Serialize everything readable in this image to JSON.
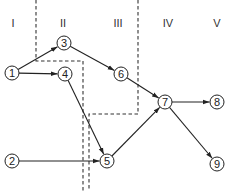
{
  "diagram": {
    "type": "network-stage-diagram",
    "stages": [
      {
        "id": "I",
        "label": "I",
        "x": 13,
        "y": 27
      },
      {
        "id": "II",
        "label": "II",
        "x": 63,
        "y": 27
      },
      {
        "id": "III",
        "label": "III",
        "x": 118,
        "y": 27
      },
      {
        "id": "IV",
        "label": "IV",
        "x": 168,
        "y": 27
      },
      {
        "id": "V",
        "label": "V",
        "x": 217,
        "y": 27
      }
    ],
    "nodes": [
      {
        "id": "1",
        "label": "1",
        "x": 12,
        "y": 73
      },
      {
        "id": "2",
        "label": "2",
        "x": 12,
        "y": 161
      },
      {
        "id": "3",
        "label": "3",
        "x": 64,
        "y": 43
      },
      {
        "id": "4",
        "label": "4",
        "x": 65,
        "y": 74
      },
      {
        "id": "5",
        "label": "5",
        "x": 107,
        "y": 161
      },
      {
        "id": "6",
        "label": "6",
        "x": 121,
        "y": 74
      },
      {
        "id": "7",
        "label": "7",
        "x": 165,
        "y": 102
      },
      {
        "id": "8",
        "label": "8",
        "x": 217,
        "y": 102
      },
      {
        "id": "9",
        "label": "9",
        "x": 217,
        "y": 164
      }
    ],
    "edges": [
      {
        "from": "1",
        "to": "3"
      },
      {
        "from": "1",
        "to": "4"
      },
      {
        "from": "3",
        "to": "6"
      },
      {
        "from": "4",
        "to": "5"
      },
      {
        "from": "2",
        "to": "5"
      },
      {
        "from": "6",
        "to": "7"
      },
      {
        "from": "5",
        "to": "7"
      },
      {
        "from": "7",
        "to": "8"
      },
      {
        "from": "7",
        "to": "9"
      }
    ],
    "cut_lines": [
      {
        "id": "cut-1",
        "points": "36,0 36,61 83,61 83,191"
      },
      {
        "id": "cut-2",
        "points": "138,0 138,114 89,114 89,191"
      }
    ],
    "colors": {
      "line": "#222222",
      "dashed": "#333333",
      "node_fill": "#ffffff"
    },
    "node_radius": 7
  }
}
